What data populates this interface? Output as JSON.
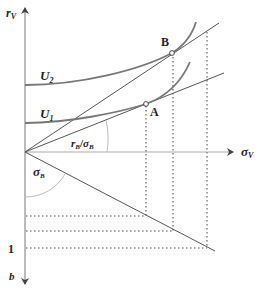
{
  "diagram": {
    "axes": {
      "y_up_label": "r",
      "y_up_sub": "V",
      "x_label": "σ",
      "x_sub": "V",
      "y_down_label": "b",
      "y_down_tick": "1"
    },
    "curves": {
      "u2": "U",
      "u2_sub": "2",
      "u1": "U",
      "u1_sub": "1"
    },
    "points": {
      "a": "A",
      "b": "B"
    },
    "angles": {
      "upper_num": "r",
      "upper_num_sub": "B",
      "upper_slash": "/",
      "upper_den": "σ",
      "upper_den_sub": "B",
      "lower": "σ",
      "lower_sub": "B"
    },
    "colors": {
      "line": "#555555",
      "curve": "#777777",
      "dots": "#888888",
      "text": "#222222"
    }
  }
}
